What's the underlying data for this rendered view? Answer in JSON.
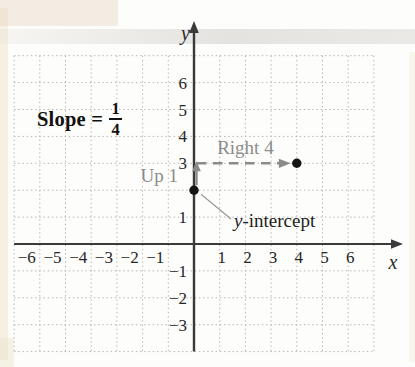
{
  "chart_data": {
    "type": "scatter",
    "points": [
      [
        0,
        2
      ],
      [
        4,
        3
      ]
    ],
    "slope": {
      "label": "Slope =",
      "numerator": "1",
      "denominator": "4"
    },
    "movements": [
      {
        "label": "Up 1",
        "from": [
          0,
          2
        ],
        "to": [
          0,
          3
        ],
        "style": "solid"
      },
      {
        "label": "Right 4",
        "from": [
          0,
          3
        ],
        "to": [
          4,
          3
        ],
        "style": "dashed"
      }
    ],
    "point_annotations": [
      {
        "text": "y-intercept",
        "point": [
          0,
          2
        ]
      }
    ],
    "axes": {
      "x_label": "x",
      "y_label": "y",
      "x_tick_labels": [
        -6,
        -5,
        -4,
        -3,
        -2,
        -1,
        1,
        2,
        3,
        4,
        5,
        6
      ],
      "y_tick_labels": [
        6,
        5,
        4,
        3,
        1,
        -1,
        -2,
        -3
      ],
      "x_range": [
        -7,
        7
      ],
      "y_range": [
        -4,
        7
      ],
      "grid": "dotted"
    },
    "colors": {
      "axis": "#3a3a3a",
      "grid_dots": "#b3b3b3",
      "annotation_gray": "#8b8b8b",
      "point": "#151515",
      "leader": "#9b9b9b",
      "tick_text": "#262626"
    }
  }
}
